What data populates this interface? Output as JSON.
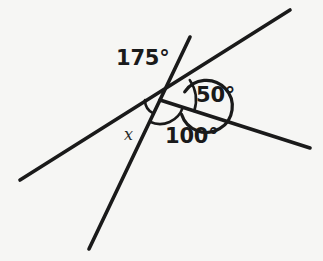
{
  "figure": {
    "type": "geometry-angle-diagram",
    "background_color": "#f6f6f4",
    "stroke_color": "#1a1a1a",
    "width": 323,
    "height": 261
  },
  "vertex": {
    "label": "intersection-point",
    "x": 160,
    "y": 100
  },
  "rays": [
    {
      "name": "ray-lower-left",
      "from": [
        160,
        100
      ],
      "to": [
        20,
        180
      ],
      "description": "shallow line going down-left"
    },
    {
      "name": "ray-upper-right",
      "from": [
        160,
        100
      ],
      "to": [
        290,
        10
      ],
      "description": "shallow line going up-right"
    },
    {
      "name": "ray-bottom",
      "from": [
        160,
        100
      ],
      "to": [
        89,
        249
      ],
      "description": "steep line going down-left-steeply"
    },
    {
      "name": "ray-right",
      "from": [
        160,
        100
      ],
      "to": [
        310,
        148
      ],
      "description": "line going right and slightly down"
    }
  ],
  "arcs": [
    {
      "name": "arc-175",
      "measure_label": "175°",
      "radius": 26,
      "start_deg": 34,
      "end_deg": 342,
      "reflex": true
    },
    {
      "name": "arc-50",
      "measure_label": "50°",
      "radius": 36,
      "start_deg": -18,
      "end_deg": 34,
      "reflex": false
    },
    {
      "name": "arc-100",
      "measure_label": "100°",
      "radius": 24,
      "start_deg": -18,
      "end_deg": -115,
      "reflex": false
    },
    {
      "name": "arc-x",
      "measure_label": "x",
      "radius": 15,
      "start_deg": -115,
      "end_deg": -180,
      "reflex": false
    }
  ],
  "labels": {
    "angle_175": "175°",
    "angle_50": "50°",
    "angle_100": "100°",
    "angle_unknown": "x"
  }
}
